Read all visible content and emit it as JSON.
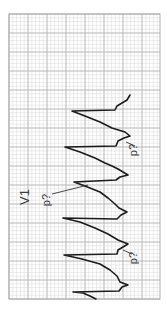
{
  "figure": {
    "lead_label": "V1",
    "annotations": [
      {
        "text": "p?",
        "x": 137,
        "y": 150,
        "line": [
          [
            126,
            142
          ],
          [
            135,
            146
          ]
        ]
      },
      {
        "text": "p?",
        "x": 50,
        "y": 200,
        "line": [
          [
            52,
            194
          ],
          [
            88,
            185
          ]
        ]
      },
      {
        "text": "p?",
        "x": 137,
        "y": 258,
        "line": [
          [
            123,
            250
          ],
          [
            132,
            254
          ]
        ]
      }
    ],
    "grid": {
      "left": 9,
      "top": 14,
      "right": 160,
      "bottom": 299,
      "minor_step": 3.8,
      "major_step": 19,
      "minor_color": "#d8d8d8",
      "major_color": "#b4b4b4",
      "border_color": "#a8a8a8"
    },
    "trace_color": "#1c1c1c",
    "trace_points": [
      [
        130,
        95
      ],
      [
        127,
        100
      ],
      [
        117,
        106
      ],
      [
        115,
        110
      ],
      [
        72,
        111
      ],
      [
        85,
        116
      ],
      [
        100,
        122
      ],
      [
        112,
        128
      ],
      [
        125,
        132
      ],
      [
        130,
        136
      ],
      [
        124,
        138
      ],
      [
        118,
        141
      ],
      [
        116,
        146
      ],
      [
        65,
        147
      ],
      [
        80,
        152
      ],
      [
        95,
        158
      ],
      [
        105,
        163
      ],
      [
        112,
        166
      ],
      [
        118,
        169
      ],
      [
        123,
        172
      ],
      [
        128,
        175
      ],
      [
        120,
        177
      ],
      [
        116,
        180
      ],
      [
        74,
        182
      ],
      [
        85,
        186
      ],
      [
        100,
        192
      ],
      [
        108,
        198
      ],
      [
        115,
        204
      ],
      [
        119,
        208
      ],
      [
        127,
        212
      ],
      [
        121,
        215
      ],
      [
        117,
        219
      ],
      [
        63,
        218
      ],
      [
        80,
        222
      ],
      [
        95,
        228
      ],
      [
        108,
        234
      ],
      [
        118,
        240
      ],
      [
        128,
        244
      ],
      [
        123,
        247
      ],
      [
        118,
        250
      ],
      [
        117,
        254
      ],
      [
        64,
        255
      ],
      [
        82,
        259
      ],
      [
        100,
        264
      ],
      [
        110,
        270
      ],
      [
        117,
        276
      ],
      [
        120,
        282
      ],
      [
        128,
        285
      ],
      [
        122,
        287
      ],
      [
        119,
        291
      ],
      [
        73,
        292
      ],
      [
        83,
        293
      ],
      [
        90,
        296
      ],
      [
        96,
        299
      ]
    ]
  }
}
